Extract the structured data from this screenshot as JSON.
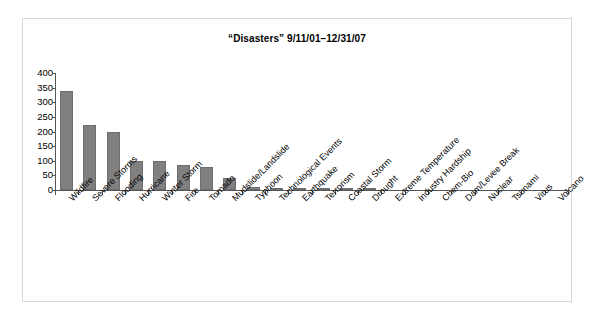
{
  "chart_data": {
    "type": "bar",
    "title": "“Disasters” 9/11/01–12/31/07",
    "xlabel": "",
    "ylabel": "",
    "ylim": [
      0,
      400
    ],
    "ytick_step": 50,
    "grid": false,
    "legend": "none",
    "bar_color": "#808080",
    "categories": [
      "Wildfire",
      "Severe Storms",
      "Flooding",
      "Hurricane",
      "Winter Storm",
      "Fire",
      "Tornado",
      "Mudslide/Landslide",
      "Typhoon",
      "Technological Events",
      "Earthquake",
      "Terrorism",
      "Coastal Storm",
      "Drought",
      "Extreme Temperature",
      "Industry Hardship",
      "Chem-Bio",
      "Dam/Levee Break",
      "Nuclear",
      "Tsunami",
      "Virus",
      "Volcano"
    ],
    "values": [
      340,
      222,
      198,
      100,
      98,
      85,
      80,
      40,
      12,
      8,
      5,
      4,
      4,
      3,
      1,
      1,
      1,
      1,
      0,
      0,
      0,
      0
    ],
    "ytick_labels": [
      "400",
      "350",
      "300",
      "250",
      "200",
      "150",
      "100",
      "50",
      "0"
    ],
    "ytick_values": [
      400,
      350,
      300,
      250,
      200,
      150,
      100,
      50,
      0
    ]
  }
}
